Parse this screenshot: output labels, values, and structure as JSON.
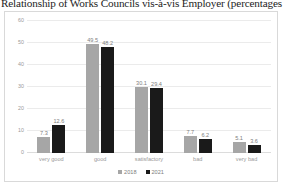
{
  "figure": {
    "title": "Relationship of Works Councils vis-à-vis Employer (percentages"
  },
  "colors": {
    "series_2018": "#a6a6a6",
    "series_2021": "#1a1a1a",
    "gridline": "#ebebeb",
    "frame_border": "#d9d9d9",
    "tick_text": "#9a9a9a"
  },
  "chart_data": {
    "type": "bar",
    "title": "Relationship of Works Councils vis-à-vis Employer (percentages",
    "xlabel": "",
    "ylabel": "",
    "ylim": [
      0,
      60
    ],
    "yticks": [
      0,
      10,
      20,
      30,
      40,
      50,
      60
    ],
    "ytick_labels": [
      "0",
      "10",
      "20",
      "30",
      "40",
      "50",
      "60"
    ],
    "grid": true,
    "legend_position": "bottom",
    "categories": [
      "very good",
      "good",
      "satisfactory",
      "bad",
      "very bad"
    ],
    "series": [
      {
        "name": "2018",
        "color": "#a6a6a6",
        "values": [
          7.3,
          49.5,
          30.1,
          7.7,
          5.1
        ]
      },
      {
        "name": "2021",
        "color": "#1a1a1a",
        "values": [
          12.6,
          48.2,
          29.4,
          6.2,
          3.6
        ]
      }
    ],
    "data_labels": [
      [
        "7.3",
        "12.6"
      ],
      [
        "49.5",
        "48.2"
      ],
      [
        "30.1",
        "29.4"
      ],
      [
        "7.7",
        "6.2"
      ],
      [
        "5.1",
        "3.6"
      ]
    ]
  }
}
